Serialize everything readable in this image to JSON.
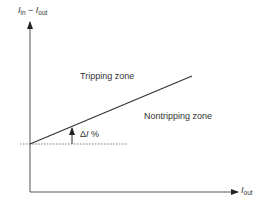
{
  "diagram": {
    "y_axis_label": {
      "var": "I",
      "sub1": "in",
      "op": " − ",
      "var2": "I",
      "sub2": "out"
    },
    "x_axis_label": {
      "var": "I",
      "sub": "out"
    },
    "regions": {
      "upper": "Tripping zone",
      "lower": "Nontripping zone"
    },
    "offset_label": {
      "prefix": "Δ",
      "var": "I",
      "suffix": " %"
    },
    "colors": {
      "line": "#333333",
      "axis": "#444444",
      "background": "#ffffff"
    }
  }
}
